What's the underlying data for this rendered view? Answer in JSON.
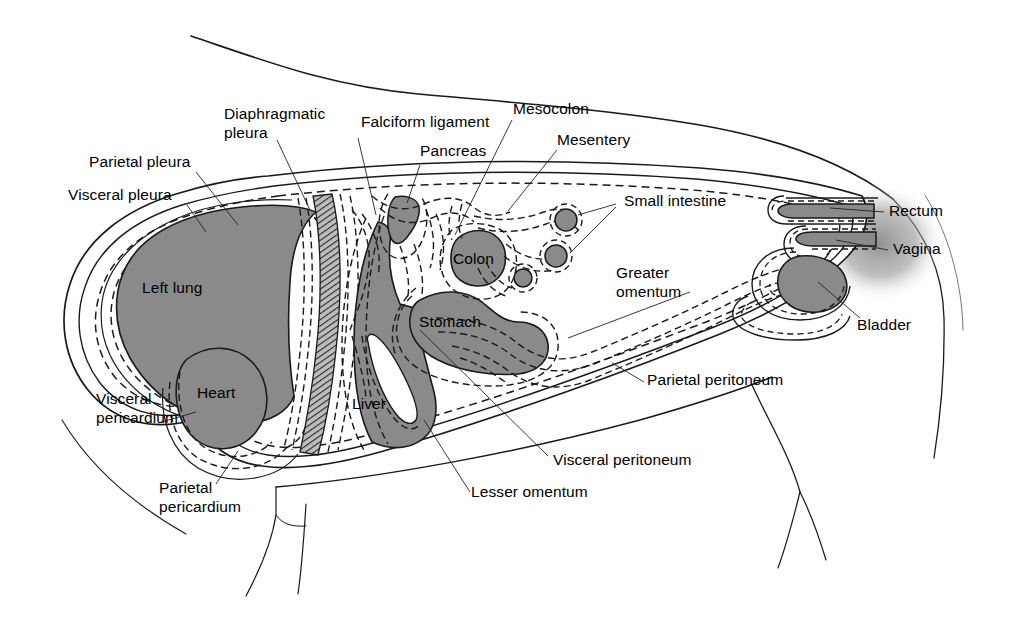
{
  "figure": {
    "type": "anatomical-diagram",
    "background_color": "#ffffff",
    "organ_fill_color": "#8a8a8a",
    "organ_stroke_color": "#1a1a1a",
    "membrane_dash_color": "#1a1a1a",
    "outline_color": "#1a1a1a",
    "diaphragm_hatch_color": "#555555",
    "shadow_color": "#9a9a9a"
  },
  "labels": {
    "parietal_pleura": "Parietal pleura",
    "visceral_pleura": "Visceral pleura",
    "diaphragmatic_pleura_line1": "Diaphragmatic",
    "diaphragmatic_pleura_line2": "pleura",
    "falciform_ligament": "Falciform ligament",
    "pancreas": "Pancreas",
    "mesocolon": "Mesocolon",
    "mesentery": "Mesentery",
    "small_intestine": "Small intestine",
    "rectum": "Rectum",
    "vagina": "Vagina",
    "bladder": "Bladder",
    "greater_omentum_line1": "Greater",
    "greater_omentum_line2": "omentum",
    "parietal_peritoneum": "Parietal peritoneum",
    "visceral_peritoneum": "Visceral peritoneum",
    "lesser_omentum": "Lesser omentum",
    "left_lung": "Left lung",
    "heart": "Heart",
    "liver": "Liver",
    "stomach": "Stomach",
    "colon": "Colon",
    "visceral_pericardium_line1": "Visceral",
    "visceral_pericardium_line2": "pericardium",
    "parietal_pericardium_line1": "Parietal",
    "parietal_pericardium_line2": "pericardium"
  },
  "organs": [
    {
      "name": "left-lung",
      "label": "Left lung"
    },
    {
      "name": "heart",
      "label": "Heart"
    },
    {
      "name": "liver",
      "label": "Liver"
    },
    {
      "name": "stomach",
      "label": "Stomach"
    },
    {
      "name": "colon",
      "label": "Colon"
    },
    {
      "name": "pancreas",
      "label": "Pancreas"
    },
    {
      "name": "small-intestine",
      "label": "Small intestine"
    },
    {
      "name": "rectum",
      "label": "Rectum"
    },
    {
      "name": "vagina",
      "label": "Vagina"
    },
    {
      "name": "bladder",
      "label": "Bladder"
    }
  ],
  "membranes": [
    {
      "name": "parietal-pleura",
      "label": "Parietal pleura"
    },
    {
      "name": "visceral-pleura",
      "label": "Visceral pleura"
    },
    {
      "name": "diaphragmatic-pleura",
      "label": "Diaphragmatic pleura"
    },
    {
      "name": "visceral-pericardium",
      "label": "Visceral pericardium"
    },
    {
      "name": "parietal-pericardium",
      "label": "Parietal pericardium"
    },
    {
      "name": "parietal-peritoneum",
      "label": "Parietal peritoneum"
    },
    {
      "name": "visceral-peritoneum",
      "label": "Visceral peritoneum"
    },
    {
      "name": "falciform-ligament",
      "label": "Falciform ligament"
    },
    {
      "name": "mesocolon",
      "label": "Mesocolon"
    },
    {
      "name": "mesentery",
      "label": "Mesentery"
    },
    {
      "name": "greater-omentum",
      "label": "Greater omentum"
    },
    {
      "name": "lesser-omentum",
      "label": "Lesser omentum"
    }
  ]
}
